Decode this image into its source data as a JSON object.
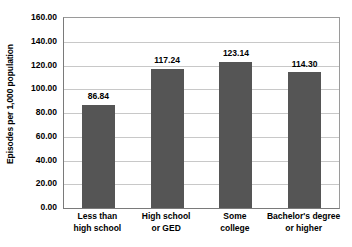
{
  "chart_data": {
    "type": "bar",
    "title": "",
    "subtitle": "",
    "xlabel": "",
    "ylabel": "Episodes per 1,000 population",
    "ylim": [
      0,
      160
    ],
    "ytick_step": 20,
    "ytick_labels": [
      "160.00",
      "140.00",
      "120.00",
      "100.00",
      "80.00",
      "60.00",
      "40.00",
      "20.00",
      "0.00"
    ],
    "ytick_values": [
      160,
      140,
      120,
      100,
      80,
      60,
      40,
      20,
      0
    ],
    "grid": "horizontal",
    "legend": "none",
    "bar_color": "#555555",
    "categories": [
      "Less than high school",
      "High school or GED",
      "Some college",
      "Bachelor's degree or higher"
    ],
    "category_lines": [
      [
        "Less than",
        "high school"
      ],
      [
        "High school",
        "or GED"
      ],
      [
        "Some",
        "college"
      ],
      [
        "Bachelor's degree",
        "or higher"
      ]
    ],
    "values": [
      86.84,
      117.24,
      123.14,
      114.3
    ],
    "value_labels": [
      "86.84",
      "117.24",
      "123.14",
      "114.30"
    ]
  }
}
